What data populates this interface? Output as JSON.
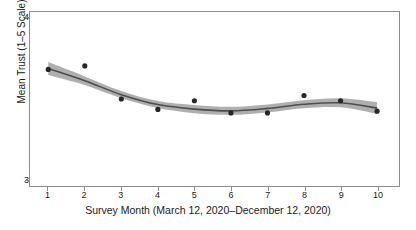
{
  "chart_data": {
    "type": "scatter",
    "title": "",
    "subtitle": "",
    "xlabel": "Survey Month (March 12, 2020–December 12, 2020)",
    "ylabel": "Mean Trust (1–5 Scale)",
    "x": [
      1,
      2,
      3,
      4,
      5,
      6,
      7,
      8,
      9,
      10
    ],
    "xtick_labels": [
      "1",
      "2",
      "3",
      "4",
      "5",
      "6",
      "7",
      "8",
      "9",
      "10"
    ],
    "ytick_labels": [
      "3",
      "4"
    ],
    "yticks": [
      3,
      4
    ],
    "xlim": [
      0.5,
      10.6
    ],
    "ylim": [
      3,
      4
    ],
    "grid": false,
    "legend": null,
    "series": [
      {
        "name": "Observed mean trust",
        "type": "scatter",
        "marker": "circle",
        "color": "#262626",
        "values": [
          3.67,
          3.69,
          3.5,
          3.44,
          3.49,
          3.42,
          3.42,
          3.52,
          3.49,
          3.43
        ]
      },
      {
        "name": "Smoothed trend (LOESS fit)",
        "type": "line",
        "color": "#4d4d4d",
        "values": [
          3.675,
          3.605,
          3.525,
          3.468,
          3.442,
          3.432,
          3.446,
          3.47,
          3.478,
          3.448
        ]
      },
      {
        "name": "95% confidence band",
        "type": "area",
        "color": "#a6a6a6",
        "lower": [
          3.638,
          3.58,
          3.504,
          3.448,
          3.418,
          3.409,
          3.423,
          3.447,
          3.452,
          3.414
        ],
        "upper": [
          3.712,
          3.63,
          3.546,
          3.488,
          3.466,
          3.455,
          3.469,
          3.493,
          3.504,
          3.482
        ]
      }
    ]
  },
  "axes": {
    "y_title": "Mean Trust (1–5 Scale)",
    "x_title": "Survey Month (March 12, 2020–December 12, 2020)",
    "y_labels": [
      "4",
      "3"
    ],
    "x_labels": [
      "1",
      "2",
      "3",
      "4",
      "5",
      "6",
      "7",
      "8",
      "9",
      "10"
    ]
  },
  "style": {
    "point_color": "#262626",
    "line_color": "#4d4d4d",
    "band_color": "#a6a6a6",
    "frame_color": "#8c8c8c",
    "background": "#ffffff"
  }
}
